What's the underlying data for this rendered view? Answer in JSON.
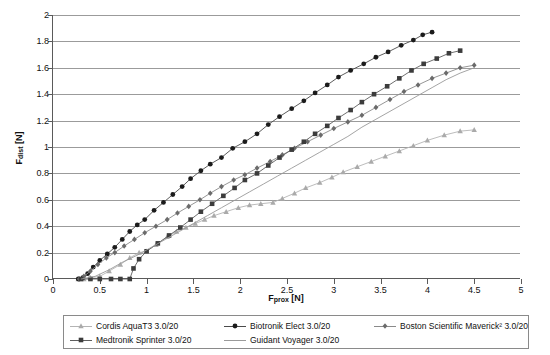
{
  "chart_data": {
    "type": "line",
    "title": "",
    "xlabel": "F_prox [N]",
    "ylabel": "F_dist [N]",
    "xlabel_display": {
      "base": "F",
      "sub": "prox",
      "unit": " [N]"
    },
    "ylabel_display": {
      "base": "F",
      "sub": "dist",
      "unit": " [N]"
    },
    "xlim": [
      0,
      5
    ],
    "ylim": [
      0,
      2
    ],
    "xticks": [
      "0",
      "0.5",
      "1",
      "1.5",
      "2",
      "2.5",
      "3",
      "3.5",
      "4",
      "4.5",
      "5"
    ],
    "xtick_values": [
      0,
      0.5,
      1,
      1.5,
      2,
      2.5,
      3,
      3.5,
      4,
      4.5,
      5
    ],
    "yticks": [
      "0",
      "0.2",
      "0.4",
      "0.6",
      "0.8",
      "1",
      "1.2",
      "1.4",
      "1.6",
      "1.8",
      "2"
    ],
    "ytick_values": [
      0,
      0.2,
      0.4,
      0.6,
      0.8,
      1,
      1.2,
      1.4,
      1.6,
      1.8,
      2
    ],
    "grid": "horizontal",
    "legend_position": "bottom",
    "series": [
      {
        "name": "Cordis AquaT3 3.0/20",
        "marker": "triangle",
        "color": "#aaaaaa",
        "line_color": "#b4b4b4",
        "points": [
          [
            0.27,
            0.0
          ],
          [
            0.33,
            0.0
          ],
          [
            0.4,
            0.01
          ],
          [
            0.5,
            0.02
          ],
          [
            0.6,
            0.06
          ],
          [
            0.72,
            0.11
          ],
          [
            0.82,
            0.16
          ],
          [
            0.92,
            0.2
          ],
          [
            1.0,
            0.21
          ],
          [
            1.1,
            0.26
          ],
          [
            1.22,
            0.32
          ],
          [
            1.32,
            0.36
          ],
          [
            1.42,
            0.39
          ],
          [
            1.52,
            0.42
          ],
          [
            1.62,
            0.45
          ],
          [
            1.72,
            0.48
          ],
          [
            1.85,
            0.51
          ],
          [
            1.98,
            0.54
          ],
          [
            2.1,
            0.56
          ],
          [
            2.22,
            0.57
          ],
          [
            2.35,
            0.58
          ],
          [
            2.45,
            0.61
          ],
          [
            2.58,
            0.65
          ],
          [
            2.7,
            0.69
          ],
          [
            2.85,
            0.73
          ],
          [
            2.98,
            0.77
          ],
          [
            3.1,
            0.81
          ],
          [
            3.25,
            0.85
          ],
          [
            3.4,
            0.89
          ],
          [
            3.55,
            0.93
          ],
          [
            3.7,
            0.97
          ],
          [
            3.85,
            1.01
          ],
          [
            4.0,
            1.05
          ],
          [
            4.18,
            1.09
          ],
          [
            4.35,
            1.12
          ],
          [
            4.5,
            1.13
          ]
        ]
      },
      {
        "name": "Biotronik Elect 3.0/20",
        "marker": "circle",
        "color": "#1b1b1b",
        "line_color": "#4a4a4a",
        "points": [
          [
            0.27,
            0.0
          ],
          [
            0.32,
            0.01
          ],
          [
            0.37,
            0.04
          ],
          [
            0.43,
            0.09
          ],
          [
            0.5,
            0.14
          ],
          [
            0.58,
            0.19
          ],
          [
            0.66,
            0.24
          ],
          [
            0.74,
            0.3
          ],
          [
            0.82,
            0.36
          ],
          [
            0.9,
            0.41
          ],
          [
            0.98,
            0.45
          ],
          [
            1.08,
            0.52
          ],
          [
            1.18,
            0.58
          ],
          [
            1.28,
            0.64
          ],
          [
            1.38,
            0.7
          ],
          [
            1.47,
            0.76
          ],
          [
            1.58,
            0.82
          ],
          [
            1.68,
            0.87
          ],
          [
            1.8,
            0.92
          ],
          [
            1.92,
            0.99
          ],
          [
            2.05,
            1.04
          ],
          [
            2.18,
            1.1
          ],
          [
            2.3,
            1.17
          ],
          [
            2.42,
            1.23
          ],
          [
            2.55,
            1.29
          ],
          [
            2.68,
            1.35
          ],
          [
            2.8,
            1.41
          ],
          [
            2.93,
            1.47
          ],
          [
            3.05,
            1.53
          ],
          [
            3.18,
            1.58
          ],
          [
            3.32,
            1.63
          ],
          [
            3.45,
            1.68
          ],
          [
            3.58,
            1.72
          ],
          [
            3.72,
            1.77
          ],
          [
            3.85,
            1.81
          ],
          [
            3.95,
            1.85
          ],
          [
            4.05,
            1.87
          ]
        ]
      },
      {
        "name": "Boston Scientific Maverick² 3.0/20",
        "marker": "diamond",
        "color": "#6b6b6b",
        "line_color": "#8a8a8a",
        "points": [
          [
            0.28,
            0.0
          ],
          [
            0.33,
            0.02
          ],
          [
            0.4,
            0.06
          ],
          [
            0.48,
            0.11
          ],
          [
            0.57,
            0.16
          ],
          [
            0.66,
            0.2
          ],
          [
            0.76,
            0.25
          ],
          [
            0.87,
            0.3
          ],
          [
            0.98,
            0.35
          ],
          [
            1.1,
            0.4
          ],
          [
            1.22,
            0.45
          ],
          [
            1.33,
            0.5
          ],
          [
            1.45,
            0.55
          ],
          [
            1.57,
            0.6
          ],
          [
            1.68,
            0.65
          ],
          [
            1.8,
            0.7
          ],
          [
            1.93,
            0.75
          ],
          [
            2.05,
            0.79
          ],
          [
            2.18,
            0.84
          ],
          [
            2.32,
            0.89
          ],
          [
            2.45,
            0.94
          ],
          [
            2.58,
            0.99
          ],
          [
            2.72,
            1.04
          ],
          [
            2.86,
            1.09
          ],
          [
            3.0,
            1.14
          ],
          [
            3.15,
            1.19
          ],
          [
            3.3,
            1.24
          ],
          [
            3.45,
            1.3
          ],
          [
            3.6,
            1.36
          ],
          [
            3.75,
            1.42
          ],
          [
            3.9,
            1.47
          ],
          [
            4.05,
            1.52
          ],
          [
            4.2,
            1.56
          ],
          [
            4.35,
            1.6
          ],
          [
            4.5,
            1.62
          ]
        ]
      },
      {
        "name": "Medtronik Sprinter 3.0/20",
        "marker": "square",
        "color": "#3c3c3c",
        "line_color": "#5e5e5e",
        "points": [
          [
            0.3,
            0.0
          ],
          [
            0.4,
            0.0
          ],
          [
            0.5,
            0.0
          ],
          [
            0.62,
            0.0
          ],
          [
            0.72,
            0.0
          ],
          [
            0.82,
            0.0
          ],
          [
            0.86,
            0.08
          ],
          [
            0.92,
            0.15
          ],
          [
            1.0,
            0.21
          ],
          [
            1.12,
            0.27
          ],
          [
            1.24,
            0.33
          ],
          [
            1.36,
            0.39
          ],
          [
            1.47,
            0.45
          ],
          [
            1.58,
            0.51
          ],
          [
            1.7,
            0.57
          ],
          [
            1.82,
            0.63
          ],
          [
            1.94,
            0.69
          ],
          [
            2.05,
            0.75
          ],
          [
            2.18,
            0.8
          ],
          [
            2.3,
            0.86
          ],
          [
            2.42,
            0.92
          ],
          [
            2.55,
            0.98
          ],
          [
            2.68,
            1.04
          ],
          [
            2.8,
            1.1
          ],
          [
            2.93,
            1.16
          ],
          [
            3.05,
            1.22
          ],
          [
            3.18,
            1.28
          ],
          [
            3.3,
            1.34
          ],
          [
            3.43,
            1.4
          ],
          [
            3.57,
            1.46
          ],
          [
            3.7,
            1.52
          ],
          [
            3.83,
            1.58
          ],
          [
            3.96,
            1.63
          ],
          [
            4.1,
            1.67
          ],
          [
            4.23,
            1.71
          ],
          [
            4.35,
            1.73
          ]
        ]
      },
      {
        "name": "Guidant Voyager 3.0/20",
        "marker": "none",
        "color": "#9a9a9a",
        "line_color": "#9a9a9a",
        "points": [
          [
            0.3,
            0.0
          ],
          [
            0.45,
            0.02
          ],
          [
            0.6,
            0.07
          ],
          [
            0.75,
            0.13
          ],
          [
            0.9,
            0.18
          ],
          [
            1.05,
            0.24
          ],
          [
            1.2,
            0.3
          ],
          [
            1.35,
            0.36
          ],
          [
            1.5,
            0.42
          ],
          [
            1.65,
            0.48
          ],
          [
            1.8,
            0.54
          ],
          [
            1.95,
            0.6
          ],
          [
            2.1,
            0.66
          ],
          [
            2.25,
            0.72
          ],
          [
            2.4,
            0.78
          ],
          [
            2.55,
            0.84
          ],
          [
            2.7,
            0.9
          ],
          [
            2.85,
            0.96
          ],
          [
            3.0,
            1.02
          ],
          [
            3.15,
            1.08
          ],
          [
            3.3,
            1.15
          ],
          [
            3.45,
            1.21
          ],
          [
            3.6,
            1.27
          ],
          [
            3.75,
            1.33
          ],
          [
            3.9,
            1.39
          ],
          [
            4.05,
            1.45
          ],
          [
            4.2,
            1.51
          ],
          [
            4.35,
            1.56
          ],
          [
            4.5,
            1.6
          ]
        ]
      }
    ]
  },
  "legend": {
    "entries": [
      {
        "label": "Cordis AquaT3 3.0/20",
        "col": 0,
        "row": 0,
        "series": 0
      },
      {
        "label": "Medtronik Sprinter 3.0/20",
        "col": 0,
        "row": 1,
        "series": 3
      },
      {
        "label": "Biotronik Elect 3.0/20",
        "col": 1,
        "row": 0,
        "series": 1
      },
      {
        "label": "Guidant Voyager 3.0/20",
        "col": 1,
        "row": 1,
        "series": 4
      },
      {
        "label": "Boston Scientific Maverick² 3.0/20",
        "col": 2,
        "row": 0,
        "series": 2
      }
    ]
  }
}
